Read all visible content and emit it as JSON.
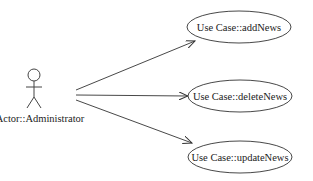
{
  "diagram": {
    "type": "use-case",
    "actor": {
      "label": "Actor::Administrator"
    },
    "use_cases": [
      {
        "label": "Use Case::addNews"
      },
      {
        "label": "Use Case::deleteNews"
      },
      {
        "label": "Use Case::updateNews"
      }
    ],
    "colors": {
      "stroke": "#333333",
      "background": "#ffffff"
    }
  }
}
